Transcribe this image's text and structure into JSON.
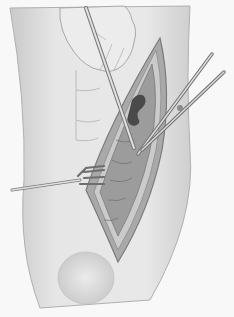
{
  "image": {
    "subject": "surgical illustration of an open incision on a limb with retractor, probe and scissors",
    "style": "grayscale pencil drawing",
    "colors": {
      "background": "#f8f8f8",
      "skin": "#e4e4e4",
      "skin_shadow": "#bdbdbd",
      "wound_edge": "#8a8a8a",
      "tissue": "#9a9a9a",
      "tissue_dark": "#4a4a4a",
      "instrument": "#d8d8d8",
      "instrument_outline": "#6e6e6e"
    }
  }
}
